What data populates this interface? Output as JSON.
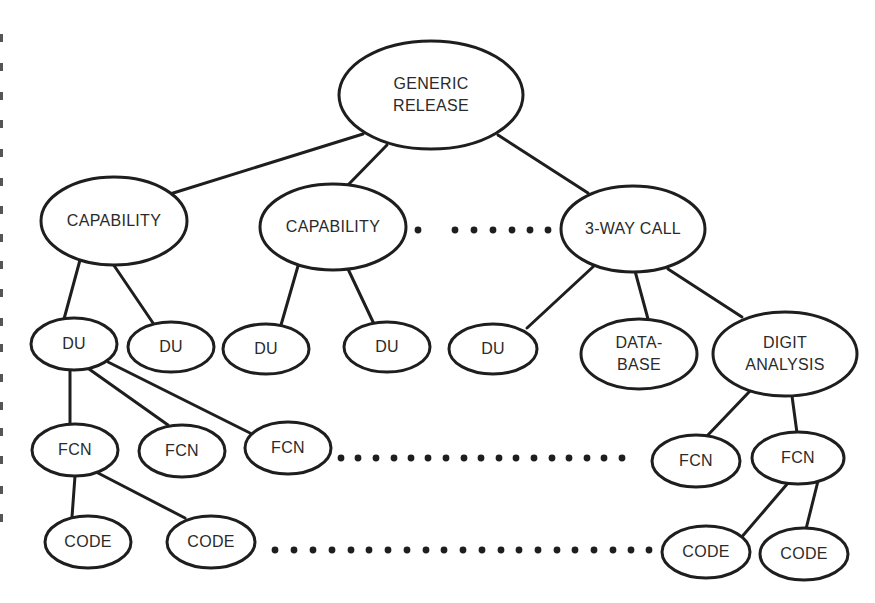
{
  "diagram": {
    "colors": {
      "stroke": "#1e1e1e",
      "text": "#2a2a2a",
      "background": "#ffffff"
    },
    "nodes": [
      {
        "id": "generic",
        "label_lines": [
          "GENERIC",
          "RELEASE"
        ],
        "cx": 431,
        "cy": 95,
        "rx": 92,
        "ry": 54
      },
      {
        "id": "cap1",
        "label_lines": [
          "CAPABILITY"
        ],
        "cx": 114,
        "cy": 221,
        "rx": 73,
        "ry": 44
      },
      {
        "id": "cap2",
        "label_lines": [
          "CAPABILITY"
        ],
        "cx": 333,
        "cy": 227,
        "rx": 73,
        "ry": 43
      },
      {
        "id": "threeway",
        "label_lines": [
          "3-WAY CALL"
        ],
        "cx": 633,
        "cy": 229,
        "rx": 72,
        "ry": 43
      },
      {
        "id": "du1",
        "label_lines": [
          "DU"
        ],
        "cx": 74,
        "cy": 344,
        "rx": 43,
        "ry": 26
      },
      {
        "id": "du2",
        "label_lines": [
          "DU"
        ],
        "cx": 171,
        "cy": 347,
        "rx": 43,
        "ry": 25
      },
      {
        "id": "du3",
        "label_lines": [
          "DU"
        ],
        "cx": 266,
        "cy": 349,
        "rx": 43,
        "ry": 25
      },
      {
        "id": "du4",
        "label_lines": [
          "DU"
        ],
        "cx": 387,
        "cy": 347,
        "rx": 43,
        "ry": 25
      },
      {
        "id": "du5",
        "label_lines": [
          "DU"
        ],
        "cx": 493,
        "cy": 349,
        "rx": 44,
        "ry": 25
      },
      {
        "id": "database",
        "label_lines": [
          "DATA-",
          "BASE"
        ],
        "cx": 639,
        "cy": 354,
        "rx": 58,
        "ry": 35
      },
      {
        "id": "digit",
        "label_lines": [
          "DIGIT",
          "ANALYSIS"
        ],
        "cx": 785,
        "cy": 354,
        "rx": 72,
        "ry": 42
      },
      {
        "id": "fcn1",
        "label_lines": [
          "FCN"
        ],
        "cx": 75,
        "cy": 450,
        "rx": 43,
        "ry": 26
      },
      {
        "id": "fcn2",
        "label_lines": [
          "FCN"
        ],
        "cx": 182,
        "cy": 451,
        "rx": 43,
        "ry": 26
      },
      {
        "id": "fcn3",
        "label_lines": [
          "FCN"
        ],
        "cx": 288,
        "cy": 448,
        "rx": 43,
        "ry": 26
      },
      {
        "id": "fcn4",
        "label_lines": [
          "FCN"
        ],
        "cx": 696,
        "cy": 461,
        "rx": 44,
        "ry": 26
      },
      {
        "id": "fcn5",
        "label_lines": [
          "FCN"
        ],
        "cx": 798,
        "cy": 458,
        "rx": 46,
        "ry": 26
      },
      {
        "id": "code1",
        "label_lines": [
          "CODE"
        ],
        "cx": 88,
        "cy": 542,
        "rx": 43,
        "ry": 26
      },
      {
        "id": "code2",
        "label_lines": [
          "CODE"
        ],
        "cx": 211,
        "cy": 542,
        "rx": 44,
        "ry": 26
      },
      {
        "id": "code3",
        "label_lines": [
          "CODE"
        ],
        "cx": 706,
        "cy": 552,
        "rx": 44,
        "ry": 26
      },
      {
        "id": "code4",
        "label_lines": [
          "CODE"
        ],
        "cx": 804,
        "cy": 554,
        "rx": 44,
        "ry": 26
      }
    ],
    "edges": [
      {
        "from": "generic",
        "to": "cap1",
        "x1": 363,
        "y1": 134,
        "x2": 170,
        "y2": 194
      },
      {
        "from": "generic",
        "to": "cap2",
        "x1": 387,
        "y1": 145,
        "x2": 348,
        "y2": 185
      },
      {
        "from": "generic",
        "to": "threeway",
        "x1": 498,
        "y1": 135,
        "x2": 588,
        "y2": 193
      },
      {
        "from": "cap1",
        "to": "du1",
        "x1": 80,
        "y1": 260,
        "x2": 64,
        "y2": 319
      },
      {
        "from": "cap1",
        "to": "du2",
        "x1": 113,
        "y1": 264,
        "x2": 153,
        "y2": 323
      },
      {
        "from": "cap2",
        "to": "du3",
        "x1": 298,
        "y1": 266,
        "x2": 281,
        "y2": 325
      },
      {
        "from": "cap2",
        "to": "du4",
        "x1": 348,
        "y1": 269,
        "x2": 374,
        "y2": 324
      },
      {
        "from": "threeway",
        "to": "du5",
        "x1": 595,
        "y1": 265,
        "x2": 527,
        "y2": 328
      },
      {
        "from": "threeway",
        "to": "database",
        "x1": 635,
        "y1": 271,
        "x2": 648,
        "y2": 319
      },
      {
        "from": "threeway",
        "to": "digit",
        "x1": 668,
        "y1": 269,
        "x2": 742,
        "y2": 317
      },
      {
        "from": "du1",
        "to": "fcn1",
        "x1": 70,
        "y1": 370,
        "x2": 70,
        "y2": 424
      },
      {
        "from": "du1",
        "to": "fcn2",
        "x1": 89,
        "y1": 369,
        "x2": 168,
        "y2": 425
      },
      {
        "from": "du1",
        "to": "fcn3",
        "x1": 108,
        "y1": 362,
        "x2": 250,
        "y2": 433
      },
      {
        "from": "digit",
        "to": "fcn4",
        "x1": 750,
        "y1": 391,
        "x2": 707,
        "y2": 436
      },
      {
        "from": "digit",
        "to": "fcn5",
        "x1": 792,
        "y1": 396,
        "x2": 797,
        "y2": 433
      },
      {
        "from": "fcn1",
        "to": "code1",
        "x1": 75,
        "y1": 476,
        "x2": 72,
        "y2": 517
      },
      {
        "from": "fcn1",
        "to": "code2",
        "x1": 98,
        "y1": 473,
        "x2": 185,
        "y2": 518
      },
      {
        "from": "fcn5",
        "to": "code3",
        "x1": 788,
        "y1": 483,
        "x2": 740,
        "y2": 539
      },
      {
        "from": "fcn5",
        "to": "code4",
        "x1": 818,
        "y1": 481,
        "x2": 806,
        "y2": 529
      }
    ],
    "ellipsis_rows": [
      {
        "id": "level1-ellipsis",
        "y": 230,
        "xs": [
          418,
          455,
          474,
          493,
          512,
          530,
          548
        ]
      },
      {
        "id": "fcn-ellipsis",
        "y": 458,
        "xs": [
          341,
          358,
          376,
          394,
          411,
          428,
          446,
          464,
          481,
          499,
          516,
          534,
          552,
          569,
          587,
          604,
          622
        ]
      },
      {
        "id": "code-ellipsis",
        "y": 550,
        "xs": [
          275,
          294,
          313,
          332,
          351,
          369,
          388,
          407,
          426,
          444,
          463,
          482,
          501,
          519,
          538,
          557,
          575,
          594,
          613,
          631,
          649
        ]
      }
    ],
    "margin_marks": [
      {
        "y": 38
      },
      {
        "y": 67
      },
      {
        "y": 96
      },
      {
        "y": 124
      },
      {
        "y": 153
      },
      {
        "y": 182
      },
      {
        "y": 210
      },
      {
        "y": 238
      },
      {
        "y": 265
      },
      {
        "y": 293
      },
      {
        "y": 322
      },
      {
        "y": 348
      },
      {
        "y": 378
      },
      {
        "y": 406
      },
      {
        "y": 432
      },
      {
        "y": 460
      },
      {
        "y": 490
      },
      {
        "y": 518
      }
    ]
  }
}
